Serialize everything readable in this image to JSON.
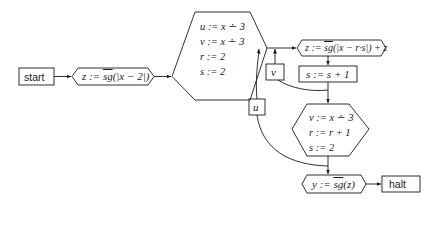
{
  "diagram": {
    "type": "flowchart",
    "nodes": {
      "start": {
        "label": "start",
        "shape": "rectangle"
      },
      "init_z": {
        "prefix": "z := ",
        "fn": "sg",
        "suffix": "(|x − 2|)",
        "shape": "hexagon-flat"
      },
      "init_block": {
        "lines": [
          "u := x ∸ 3",
          "v := x ∸ 3",
          "r := 2",
          "s := 2"
        ],
        "shape": "hexagon"
      },
      "update_z": {
        "prefix": "z := ",
        "fn": "sg",
        "suffix": "(|x − r·s|) + z",
        "shape": "hexagon-flat"
      },
      "inc_s": {
        "label": "s := s + 1",
        "shape": "rectangle"
      },
      "v_test": {
        "label": "v",
        "shape": "rectangle"
      },
      "u_test": {
        "label": "u",
        "shape": "rectangle"
      },
      "reset_block": {
        "lines": [
          "v := x ∸ 3",
          "r := r + 1",
          "s := 2"
        ],
        "shape": "hexagon"
      },
      "output_y": {
        "prefix": "y := ",
        "fn": "sg",
        "suffix": "(z)",
        "shape": "hexagon-flat"
      },
      "halt": {
        "label": "halt",
        "shape": "rectangle"
      }
    },
    "edges": [
      {
        "from": "start",
        "to": "init_z"
      },
      {
        "from": "init_z",
        "to": "init_block"
      },
      {
        "from": "init_block",
        "to": "update_z"
      },
      {
        "from": "update_z",
        "to": "inc_s"
      },
      {
        "from": "inc_s",
        "to": "v_test"
      },
      {
        "from": "v_test",
        "to": "update_z"
      },
      {
        "from": "inc_s",
        "to": "reset_block"
      },
      {
        "from": "reset_block",
        "to": "u_test"
      },
      {
        "from": "u_test",
        "to": "update_z"
      },
      {
        "from": "reset_block",
        "to": "output_y"
      },
      {
        "from": "output_y",
        "to": "halt"
      }
    ]
  }
}
